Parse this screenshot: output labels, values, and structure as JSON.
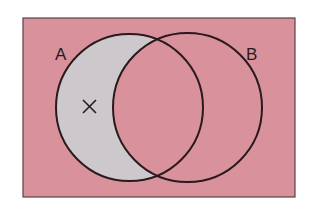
{
  "diagram": {
    "type": "venn",
    "universe": {
      "fill": "#d9929c",
      "stroke": "#5a4048"
    },
    "sets": [
      {
        "label": "A",
        "cx": 129.5,
        "cy": 107.5,
        "r": 73.5
      },
      {
        "label": "B",
        "cx": 187.5,
        "cy": 107.5,
        "r": 74.5
      }
    ],
    "shaded_region": {
      "description": "A minus B",
      "fill": "#ccc8cc"
    },
    "marker": {
      "symbol": "×",
      "region": "A only"
    },
    "stroke_color": "#2a1a1e"
  }
}
